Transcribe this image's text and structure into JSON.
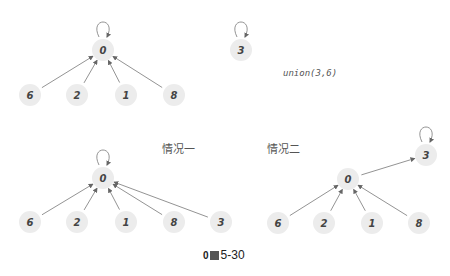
{
  "top": {
    "tree": {
      "root": {
        "label": "0",
        "x": 103,
        "y": 50,
        "self_loop": true
      },
      "children": [
        {
          "label": "6",
          "x": 30,
          "y": 95
        },
        {
          "label": "2",
          "x": 77,
          "y": 95
        },
        {
          "label": "1",
          "x": 126,
          "y": 95
        },
        {
          "label": "8",
          "x": 174,
          "y": 95
        }
      ]
    },
    "single": {
      "label": "3",
      "x": 241,
      "y": 50,
      "self_loop": true
    },
    "operation": "union(3,6)"
  },
  "case_one": {
    "title": "情况一",
    "root": {
      "label": "0",
      "x": 103,
      "y": 178,
      "self_loop": true
    },
    "children": [
      {
        "label": "6",
        "x": 30,
        "y": 222
      },
      {
        "label": "2",
        "x": 77,
        "y": 222
      },
      {
        "label": "1",
        "x": 126,
        "y": 222
      },
      {
        "label": "8",
        "x": 174,
        "y": 222
      },
      {
        "label": "3",
        "x": 221,
        "y": 222
      }
    ]
  },
  "case_two": {
    "title": "情况二",
    "top_root": {
      "label": "3",
      "x": 426,
      "y": 155,
      "self_loop": true
    },
    "root": {
      "label": "0",
      "x": 348,
      "y": 179
    },
    "children": [
      {
        "label": "6",
        "x": 278,
        "y": 223
      },
      {
        "label": "2",
        "x": 324,
        "y": 223
      },
      {
        "label": "1",
        "x": 372,
        "y": 223
      },
      {
        "label": "8",
        "x": 419,
        "y": 223
      }
    ]
  },
  "caption": {
    "prefix": "0",
    "text": "5-30"
  }
}
